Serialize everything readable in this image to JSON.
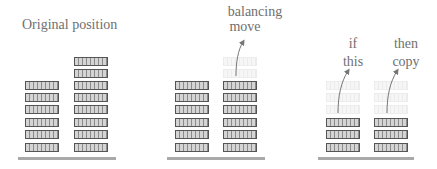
{
  "diagram": {
    "panels": [
      {
        "id": "original",
        "labels": [
          "Original position"
        ],
        "columns": [
          {
            "solid_blocks": 6,
            "ghost_blocks": 0
          },
          {
            "solid_blocks": 8,
            "ghost_blocks": 0
          }
        ]
      },
      {
        "id": "balancing",
        "labels": [
          "balancing",
          "move"
        ],
        "columns": [
          {
            "solid_blocks": 6,
            "ghost_blocks": 0
          },
          {
            "solid_blocks": 6,
            "ghost_blocks": 2
          }
        ],
        "arrows": 1
      },
      {
        "id": "copy",
        "labels": [
          "if",
          "this",
          "then",
          "copy"
        ],
        "columns": [
          {
            "solid_blocks": 3,
            "ghost_blocks": 3
          },
          {
            "solid_blocks": 3,
            "ghost_blocks": 3
          }
        ],
        "arrows": 2
      }
    ],
    "colors": {
      "block_border": "#555555",
      "block_fill": "#d4d4d4",
      "ghost": "#ececec",
      "ground": "#a9a9a9",
      "text": "#6f6f6f",
      "arrow": "#777777"
    }
  },
  "text": {
    "original_position": "Original position",
    "balancing": "balancing",
    "move": "move",
    "if": "if",
    "this": "this",
    "then": "then",
    "copy": "copy"
  }
}
